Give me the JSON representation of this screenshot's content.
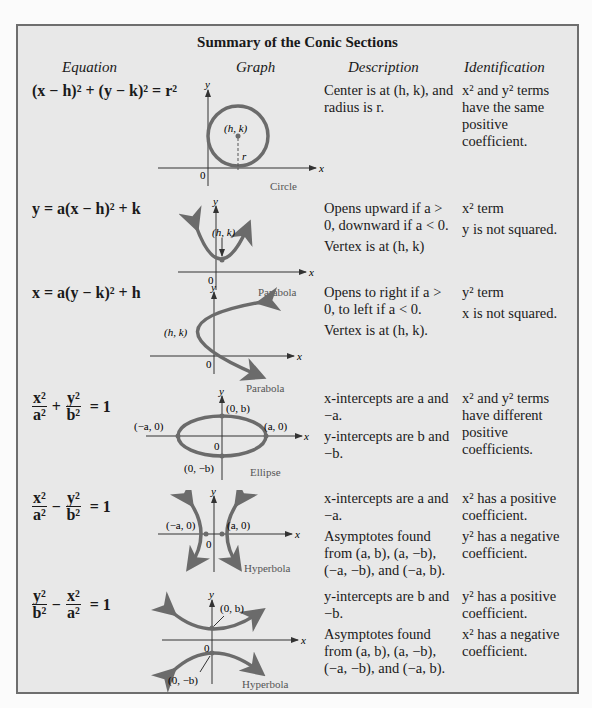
{
  "title": "Summary of the Conic Sections",
  "headers": {
    "equation": "Equation",
    "graph": "Graph",
    "description": "Description",
    "identification": "Identification"
  },
  "colors": {
    "panel": "#e8e8e8",
    "border": "#6e6e6e",
    "curve": "#6b6b6b"
  },
  "rows": [
    {
      "equation": "(x − h)² + (y − k)² = r²",
      "graph": {
        "caption": "Circle",
        "labels": [
          "(h, k)",
          "r",
          "0",
          "x",
          "y"
        ]
      },
      "description": [
        "Center is at (h, k), and radius is r."
      ],
      "identification": [
        "x² and y² terms have the same positive coefficient."
      ]
    },
    {
      "equation": "y = a(x − h)² + k",
      "graph": {
        "caption": "Parabola",
        "labels": [
          "(h, k)",
          "0",
          "x",
          "y"
        ]
      },
      "description": [
        "Opens upward if a > 0, downward if a < 0.",
        "Vertex is at (h, k)"
      ],
      "identification": [
        "x² term",
        "y is not squared."
      ]
    },
    {
      "equation": "x = a(y − k)² + h",
      "graph": {
        "caption": "Parabola",
        "labels": [
          "(h, k)",
          "0",
          "x",
          "y"
        ]
      },
      "description": [
        "Opens to right if a > 0, to left if a < 0.",
        "Vertex is at (h, k)."
      ],
      "identification": [
        "y² term",
        "x is not squared."
      ]
    },
    {
      "equation": {
        "n1": "x²",
        "d1": "a²",
        "op": "+",
        "n2": "y²",
        "d2": "b²",
        "rhs": "= 1"
      },
      "graph": {
        "caption": "Ellipse",
        "labels": [
          "(0, b)",
          "(−a, 0)",
          "(a, 0)",
          "(0, −b)",
          "0",
          "x",
          "y"
        ]
      },
      "description": [
        "x-intercepts are a and −a.",
        "y-intercepts are b and −b."
      ],
      "identification": [
        "x² and y² terms have different positive coefficients."
      ]
    },
    {
      "equation": {
        "n1": "x²",
        "d1": "a²",
        "op": "−",
        "n2": "y²",
        "d2": "b²",
        "rhs": "= 1"
      },
      "graph": {
        "caption": "Hyperbola",
        "labels": [
          "(−a, 0)",
          "(a, 0)",
          "0",
          "x",
          "y"
        ]
      },
      "description": [
        "x-intercepts are a and −a.",
        "Asymptotes found from (a, b), (a, −b), (−a, −b), and (−a, b)."
      ],
      "identification": [
        "x² has a positive coefficient.",
        "y² has a negative coefficient."
      ]
    },
    {
      "equation": {
        "n1": "y²",
        "d1": "b²",
        "op": "−",
        "n2": "x²",
        "d2": "a²",
        "rhs": "= 1"
      },
      "graph": {
        "caption": "Hyperbola",
        "labels": [
          "(0, b)",
          "(0, −b)",
          "0",
          "x",
          "y"
        ]
      },
      "description": [
        "y-intercepts are b and −b.",
        "Asymptotes found from (a, b), (a, −b), (−a, −b), and (−a, b)."
      ],
      "identification": [
        "y² has a positive coefficient.",
        "x² has a negative coefficient."
      ]
    }
  ]
}
